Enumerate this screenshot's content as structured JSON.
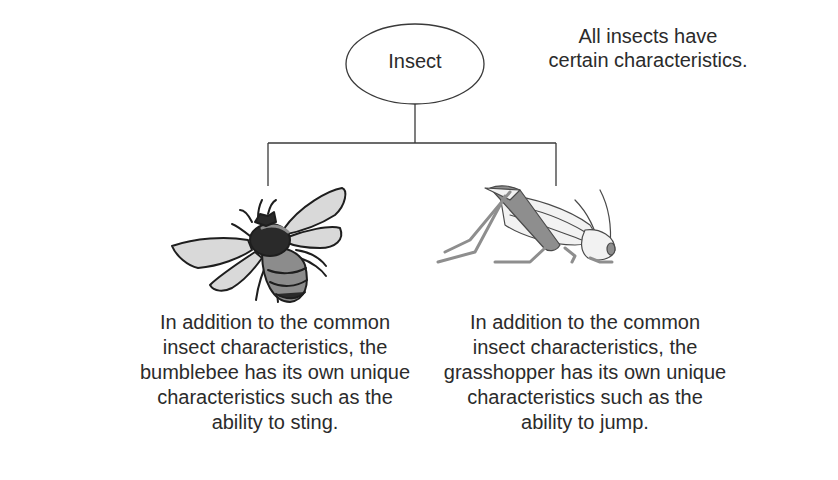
{
  "diagram": {
    "root": {
      "label": "Insect",
      "note_line1": "All insects have",
      "note_line2": "certain characteristics."
    },
    "children": [
      {
        "name": "bumblebee",
        "icon": "bumblebee-illustration",
        "lines": [
          "In addition to the common",
          "insect characteristics, the",
          "bumblebee has its own unique",
          "characteristics such as the",
          "ability to sting."
        ]
      },
      {
        "name": "grasshopper",
        "icon": "grasshopper-illustration",
        "lines": [
          "In addition to the common",
          "insect characteristics, the",
          "grasshopper has its own unique",
          "characteristics such as the",
          "ability to jump."
        ]
      }
    ],
    "colors": {
      "line": "#3a3a3a",
      "bee_dark": "#2a2a2a",
      "bee_mid": "#8c8c8c",
      "bee_wing": "#d9d9d9",
      "hopper_body": "#8e8e8e",
      "hopper_light": "#f2f2f2"
    }
  }
}
